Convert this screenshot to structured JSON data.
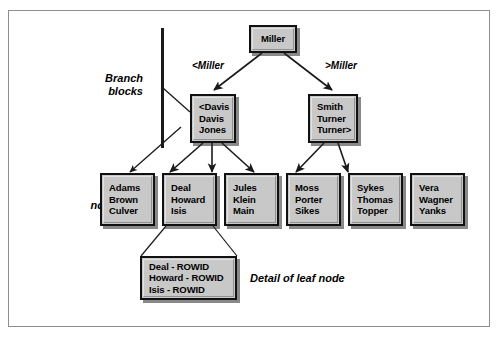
{
  "diagram": {
    "root": {
      "id": "root",
      "lines": [
        "Miller"
      ]
    },
    "edge_labels": {
      "left": "<Miller",
      "right": ">Miller"
    },
    "branch_blocks": [
      {
        "id": "branch-left",
        "lines": [
          "<Davis",
          "Davis",
          "Jones"
        ]
      },
      {
        "id": "branch-right",
        "lines": [
          "Smith",
          "Turner",
          "Turner>"
        ]
      }
    ],
    "leaf_nodes": [
      {
        "id": "leaf-1",
        "lines": [
          "Adams",
          "Brown",
          "Culver"
        ]
      },
      {
        "id": "leaf-2",
        "lines": [
          "Deal",
          "Howard",
          "Isis"
        ]
      },
      {
        "id": "leaf-3",
        "lines": [
          "Jules",
          "Klein",
          "Main"
        ]
      },
      {
        "id": "leaf-4",
        "lines": [
          "Moss",
          "Porter",
          "Sikes"
        ]
      },
      {
        "id": "leaf-5",
        "lines": [
          "Sykes",
          "Thomas",
          "Topper"
        ]
      },
      {
        "id": "leaf-6",
        "lines": [
          "Vera",
          "Wagner",
          "Yanks"
        ]
      }
    ],
    "detail_node": {
      "id": "detail-box",
      "lines": [
        "Deal - ROWID",
        "Howard - ROWID",
        "Isis - ROWID"
      ],
      "caption": "Detail of leaf node"
    },
    "side_labels": {
      "branch": [
        "Branch",
        "blocks"
      ],
      "leaf": [
        "Leaf",
        "nodes"
      ]
    },
    "colors": {
      "node_fill": "#c8c8c8",
      "node_border": "#111111",
      "frame_border": "#8e8e8e",
      "line": "#1a1a1a",
      "background": "#ffffff"
    }
  }
}
